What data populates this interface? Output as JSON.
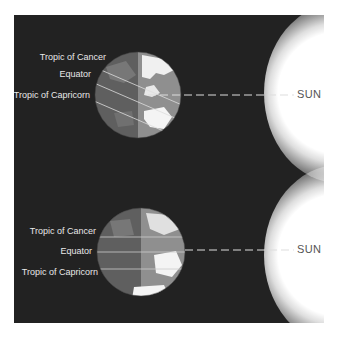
{
  "diagram": {
    "panels": [
      {
        "id": "top",
        "labels": {
          "cancer": "Tropic of Cancer",
          "equator": "Equator",
          "capricorn": "Tropic of Capricorn"
        },
        "sun_label": "SUN"
      },
      {
        "id": "bottom",
        "labels": {
          "cancer": "Tropic of Cancer",
          "equator": "Equator",
          "capricorn": "Tropic of Capricorn"
        },
        "sun_label": "SUN"
      }
    ],
    "colors": {
      "background": "#222222",
      "globe_night": "#5f5f5f",
      "globe_day": "#8f8f8f",
      "land": "#f2f2f2",
      "sun": "#ffffff",
      "dash_line": "#dddddd"
    }
  }
}
